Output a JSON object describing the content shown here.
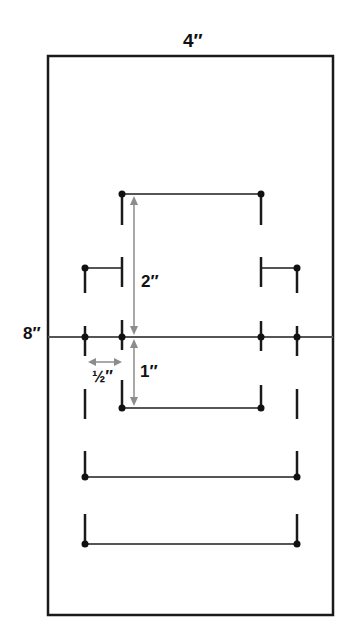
{
  "diagram": {
    "type": "dimensioned layout drawing",
    "board": {
      "width_label": "4″",
      "height_label": "8″"
    },
    "dimensions": [
      {
        "name": "vertical-upper",
        "label": "2″"
      },
      {
        "name": "vertical-lower",
        "label": "1″"
      },
      {
        "name": "horizontal-offset",
        "label": "½″"
      }
    ],
    "colors": {
      "line": "#1a1a1a",
      "segment": "#555555",
      "dimension": "#8c8c8c",
      "background": "#ffffff"
    },
    "elements": [
      "top bar with end dots and downward stubs",
      "left and right side brackets",
      "center horizontal line across board with four dots",
      "lower inner bar",
      "two lower wide bars with upward stubs"
    ]
  }
}
